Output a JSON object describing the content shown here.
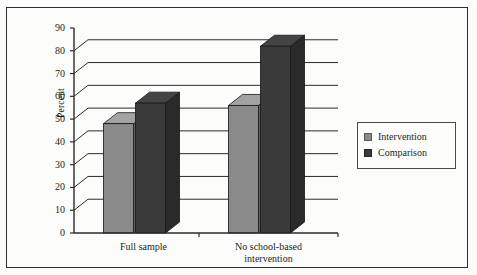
{
  "chart_data": {
    "type": "bar",
    "title": "",
    "subtitle": "",
    "xlabel": "",
    "ylabel": "Percent",
    "ylim": [
      0,
      90
    ],
    "ytick_step": 10,
    "yticks": [
      "0",
      "10",
      "20",
      "30",
      "40",
      "50",
      "60",
      "70",
      "80",
      "90"
    ],
    "grid": true,
    "grid_orientation": "horizontal",
    "style": "3d-bars",
    "legend_position": "right",
    "categories": [
      "Full sample",
      "No school-based intervention"
    ],
    "category_lines": [
      [
        "Full sample"
      ],
      [
        "No school-based",
        "intervention"
      ]
    ],
    "series": [
      {
        "name": "Intervention",
        "color": "#8a8a8a",
        "values": [
          48,
          56
        ]
      },
      {
        "name": "Comparison",
        "color": "#3a3a3a",
        "values": [
          57,
          82
        ]
      }
    ]
  },
  "legend": {
    "items": [
      {
        "label": "Intervention",
        "color": "#8a8a8a"
      },
      {
        "label": "Comparison",
        "color": "#3a3a3a"
      }
    ]
  },
  "colors": {
    "intervention": "#8a8a8a",
    "comparison": "#3a3a3a",
    "axis": "#2b2b2b",
    "grid": "#2b2b2b",
    "frame": "#2e2e2e",
    "background": "#fcfcfb"
  }
}
